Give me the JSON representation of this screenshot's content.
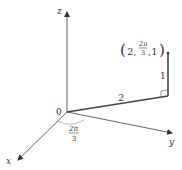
{
  "diagram": {
    "axes": {
      "x_label": "x",
      "y_label": "y",
      "z_label": "z",
      "origin_label": "0"
    },
    "point_label": {
      "open": "(",
      "r": "2,",
      "theta_num": "2π",
      "theta_den": "3",
      "z": ",1",
      "close": ")"
    },
    "segment_labels": {
      "radius": "2",
      "height": "1"
    },
    "angle_label": {
      "num": "2π",
      "den": "3"
    },
    "colors": {
      "line": "#555555",
      "text": "#333333",
      "arc": "#aaaaaa"
    }
  }
}
